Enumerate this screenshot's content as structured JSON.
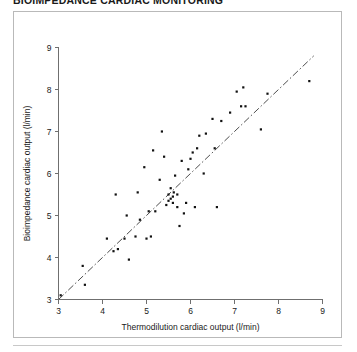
{
  "top_caption": "BIOIMPEDANCE CARDIAC MONITORING",
  "chart_data": {
    "type": "scatter",
    "title": "",
    "xlabel": "Thermodilution cardiac output (l/min)",
    "ylabel": "Bioimpedance cardiac output (l/min)",
    "xlim": [
      3,
      9
    ],
    "ylim": [
      3,
      9
    ],
    "xticks": [
      3,
      4,
      5,
      6,
      7,
      8,
      9
    ],
    "yticks": [
      3,
      4,
      5,
      6,
      7,
      8,
      9
    ],
    "xtick_labels": [
      "3",
      "4",
      "5",
      "6",
      "7",
      "8",
      "9"
    ],
    "ytick_labels": [
      "3",
      "4",
      "5",
      "6",
      "7",
      "8",
      "9"
    ],
    "grid": false,
    "legend": "none",
    "marker": {
      "shape": "square",
      "size_px": 2.2,
      "color": "#111111"
    },
    "reference_line": {
      "name": "line-of-identity",
      "style": "dash-dot",
      "from": [
        3.0,
        3.0
      ],
      "to": [
        8.8,
        8.8
      ],
      "color": "#3a3a3a"
    },
    "x": [
      3.05,
      3.55,
      3.6,
      4.1,
      4.25,
      4.3,
      4.35,
      4.5,
      4.55,
      4.6,
      4.75,
      4.8,
      4.85,
      4.95,
      5.0,
      5.05,
      5.1,
      5.15,
      5.2,
      5.3,
      5.35,
      5.4,
      5.45,
      5.5,
      5.5,
      5.55,
      5.55,
      5.6,
      5.6,
      5.62,
      5.65,
      5.7,
      5.7,
      5.75,
      5.8,
      5.85,
      5.9,
      5.95,
      6.0,
      6.05,
      6.1,
      6.15,
      6.2,
      6.3,
      6.35,
      6.5,
      6.55,
      6.6,
      6.7,
      6.9,
      7.05,
      7.15,
      7.2,
      7.25,
      7.6,
      7.75,
      8.7
    ],
    "y": [
      3.1,
      3.8,
      3.35,
      4.45,
      4.15,
      5.5,
      4.2,
      4.45,
      5.0,
      3.95,
      4.5,
      5.55,
      4.9,
      6.15,
      4.45,
      5.1,
      4.5,
      6.55,
      5.1,
      5.85,
      7.0,
      6.4,
      5.25,
      5.35,
      5.5,
      5.4,
      5.65,
      5.3,
      5.45,
      5.55,
      5.95,
      5.2,
      5.5,
      4.75,
      6.3,
      5.05,
      5.3,
      6.1,
      6.35,
      6.5,
      5.2,
      6.6,
      6.9,
      6.0,
      6.95,
      7.3,
      6.6,
      5.2,
      7.25,
      7.45,
      7.95,
      7.6,
      8.05,
      7.6,
      7.05,
      7.9,
      8.2
    ]
  }
}
